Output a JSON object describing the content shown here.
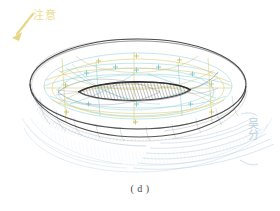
{
  "figure": {
    "caption": "( d )",
    "medium": "hand-drawn pencil and colored-pencil sketch on white paper",
    "background_color": "#ffffff"
  },
  "annotation": {
    "label": "注意",
    "color": "#e8d97a",
    "arrow_name": "annotation-arrow",
    "arrow_direction": "down-left"
  },
  "signature": {
    "text": "吴分",
    "color": "#b6cede",
    "orientation": "vertical"
  },
  "palette": {
    "outline_dark": "#3c3c3c",
    "outline_mid": "#6b6b6b",
    "construction_cyan": "#8fd3d8",
    "construction_teal": "#6fbfc6",
    "construction_yellow": "#d8cb72",
    "construction_olive": "#c2bb6a",
    "shadow_blue": "#a9c6dd",
    "hatch_grey": "#55555a",
    "paper": "#ffffff"
  },
  "geometry": {
    "outer_ellipse": {
      "cx": 138,
      "cy": 83,
      "rx": 108,
      "ry": 45
    },
    "bottom_ellipse": {
      "cx": 138,
      "cy": 110,
      "rx": 108,
      "ry": 45
    },
    "inner_hole": {
      "cx": 134,
      "cy": 92,
      "rx": 55,
      "ry": 12
    },
    "cross_marks": 16,
    "shadow_hatch_lines": 14
  },
  "elements": {
    "outer_rim_name": "torus-outer-rim",
    "inner_hole_name": "torus-inner-hole",
    "body_name": "torus-body",
    "shadow_name": "ground-shadow",
    "construction_name": "construction-lines"
  }
}
